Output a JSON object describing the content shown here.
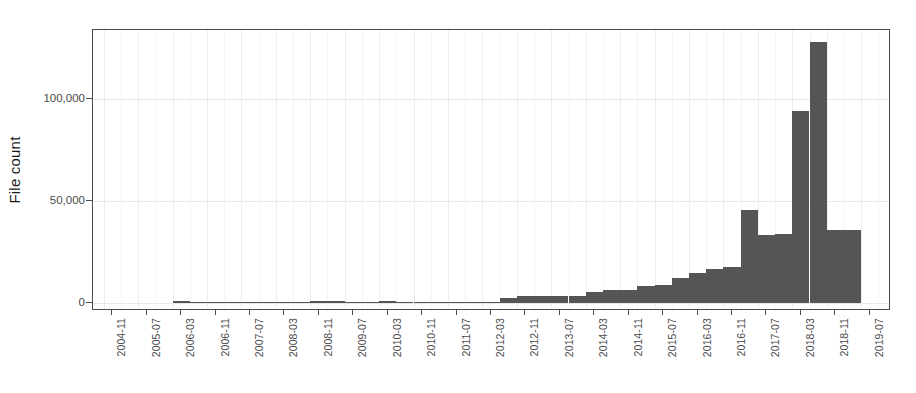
{
  "chart_data": {
    "type": "bar",
    "title": "",
    "xlabel": "",
    "ylabel": "File count",
    "ylim": [
      0,
      137000
    ],
    "yticks": [
      0,
      50000,
      100000
    ],
    "ytick_labels": [
      "0",
      "50,000",
      "100,000"
    ],
    "grid": true,
    "legend": null,
    "bar_color": "#555555",
    "axis_color": "#4a4a4a",
    "grid_color": "#e8e8e8",
    "xtick_labels": [
      "2004-11",
      "2005-07",
      "2006-03",
      "2006-11",
      "2007-07",
      "2008-03",
      "2008-11",
      "2009-07",
      "2010-03",
      "2010-11",
      "2011-07",
      "2012-03",
      "2012-11",
      "2013-07",
      "2014-03",
      "2014-11",
      "2015-07",
      "2016-03",
      "2016-11",
      "2017-07",
      "2018-03",
      "2018-11",
      "2019-07",
      "2020-03"
    ],
    "categories": [
      "2004-11",
      "2005-03",
      "2005-07",
      "2005-11",
      "2006-03",
      "2006-07",
      "2006-11",
      "2007-03",
      "2007-07",
      "2007-11",
      "2008-03",
      "2008-07",
      "2008-11",
      "2009-03",
      "2009-07",
      "2009-11",
      "2010-03",
      "2010-07",
      "2010-11",
      "2011-03",
      "2011-07",
      "2011-11",
      "2012-03",
      "2012-07",
      "2012-11",
      "2013-03",
      "2013-07",
      "2013-11",
      "2014-03",
      "2014-07",
      "2014-11",
      "2015-03",
      "2015-07",
      "2015-11",
      "2016-03",
      "2016-07",
      "2016-11",
      "2017-03",
      "2017-07",
      "2017-11",
      "2018-03",
      "2018-07",
      "2018-11",
      "2019-03",
      "2019-07"
    ],
    "values": [
      0,
      0,
      0,
      0,
      900,
      700,
      300,
      200,
      600,
      500,
      400,
      700,
      1100,
      800,
      400,
      600,
      900,
      500,
      200,
      100,
      100,
      200,
      300,
      2500,
      3200,
      3300,
      3400,
      3500,
      5500,
      6200,
      6500,
      8500,
      9000,
      12500,
      14500,
      16500,
      17500,
      45500,
      33500,
      34000,
      94000,
      128000,
      36000,
      36000,
      0
    ]
  }
}
